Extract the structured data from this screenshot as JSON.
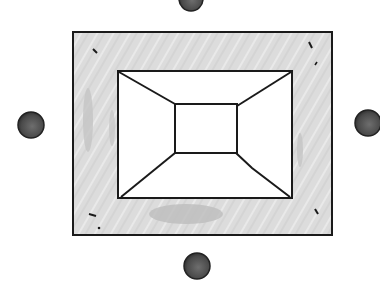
{
  "diagram": {
    "colors": {
      "background": "#ffffff",
      "frame_fill": "#dcdcdc",
      "frame_smudge": "#bdbdbd",
      "line": "#1a1a1a",
      "inner_fill": "#ffffff",
      "dot_fill": "#4a4a4a",
      "dot_highlight": "#6e6e6e"
    },
    "outer_frame": {
      "x": 73,
      "y": 32,
      "w": 259,
      "h": 203
    },
    "inner_rect": {
      "x": 118,
      "y": 71,
      "w": 174,
      "h": 127
    },
    "back_wall": {
      "x": 175,
      "y": 104,
      "w": 62,
      "h": 49
    },
    "dots": [
      {
        "name": "top",
        "cx": 191,
        "cy": -1,
        "r": 12
      },
      {
        "name": "left",
        "cx": 31,
        "cy": 125,
        "r": 13
      },
      {
        "name": "right",
        "cx": 368,
        "cy": 123,
        "r": 13
      },
      {
        "name": "bottom",
        "cx": 197,
        "cy": 266,
        "r": 13
      }
    ]
  }
}
